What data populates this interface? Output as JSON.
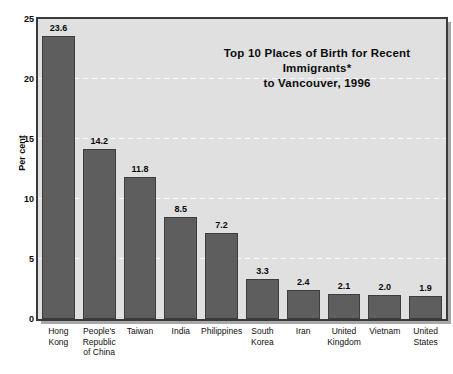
{
  "chart_data": {
    "type": "bar",
    "title_line1": "Top 10 Places of Birth for Recent Immigrants*",
    "title_line2": "to Vancouver, 1996",
    "xlabel": "",
    "ylabel": "Per cent",
    "ylim": [
      0,
      25
    ],
    "yticks": [
      0,
      5,
      10,
      15,
      20,
      25
    ],
    "ytick_labels": [
      "0",
      "5",
      "10",
      "15",
      "20",
      "25"
    ],
    "grid": true,
    "grid_axis": "y",
    "grid_style": "dashed-white",
    "legend": null,
    "categories": [
      "Hong Kong",
      "People's Republic of China",
      "Taiwan",
      "India",
      "Philippines",
      "South Korea",
      "Iran",
      "United Kingdom",
      "Vietnam",
      "United States"
    ],
    "category_label_lines": [
      [
        "Hong",
        "Kong"
      ],
      [
        "People's",
        "Republic",
        "of China"
      ],
      [
        "Taiwan"
      ],
      [
        "India"
      ],
      [
        "Philippines"
      ],
      [
        "South",
        "Korea"
      ],
      [
        "Iran"
      ],
      [
        "United",
        "Kingdom"
      ],
      [
        "Vietnam"
      ],
      [
        "United",
        "States"
      ]
    ],
    "values": [
      23.6,
      14.2,
      11.8,
      8.5,
      7.2,
      3.3,
      2.4,
      2.1,
      2.0,
      1.9
    ],
    "value_labels": [
      "23.6",
      "14.2",
      "11.8",
      "8.5",
      "7.2",
      "3.3",
      "2.4",
      "2.1",
      "2.0",
      "1.9"
    ],
    "colors": {
      "bar_fill": "#5e5e5e",
      "bar_edge": "#3d3d3d",
      "plot_background": "#e0e0e0",
      "gridline": "#fafafa",
      "frame_border": "#3a3a3a",
      "frame_shadow": "#a8a8a8",
      "text": "#0a0a0a",
      "figure_background": "#ffffff"
    }
  }
}
